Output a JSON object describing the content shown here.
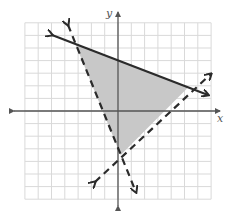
{
  "chart_data": {
    "type": "line",
    "title": "",
    "xlabel": "x",
    "ylabel": "y",
    "xlim": [
      -7,
      7
    ],
    "ylim": [
      -7,
      7
    ],
    "grid": true,
    "grid_step": 1,
    "tick_labels": false,
    "legend": null,
    "series": [
      {
        "name": "solid boundary",
        "style": "solid",
        "equation": "y = -0.4x + 4",
        "endpoints": [
          [
            -4.96,
            6.03
          ],
          [
            6.77,
            1.27
          ]
        ],
        "arrows": "both"
      },
      {
        "name": "dashed boundary 1",
        "style": "dashed",
        "equation": "y = -2.6x - 3",
        "endpoints": [
          [
            -3.76,
            6.83
          ],
          [
            1.35,
            -6.43
          ]
        ],
        "arrows": "both"
      },
      {
        "name": "dashed boundary 2",
        "style": "dashed",
        "equation": "y = x - 4",
        "endpoints": [
          [
            -1.73,
            -5.63
          ],
          [
            6.99,
            2.94
          ]
        ],
        "arrows": "both"
      }
    ],
    "shaded_region": {
      "shape": "triangle",
      "vertices": [
        [
          -3.2,
          5.3
        ],
        [
          5.3,
          1.9
        ],
        [
          0.2,
          -3.5
        ]
      ],
      "fill": "#c8c8c8"
    }
  },
  "labels": {
    "x": "x",
    "y": "y"
  },
  "colors": {
    "grid": "#d9d9d9",
    "axis": "#555555",
    "line": "#2b2b2b",
    "shade": "#c8c8c8"
  }
}
